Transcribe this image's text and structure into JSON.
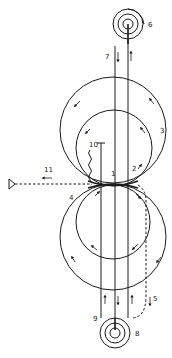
{
  "diagram": {
    "type": "technical-schematic",
    "colors": {
      "ink": "#1a1a1a",
      "background": "#ffffff"
    },
    "labels": {
      "l1": "1",
      "l2": "2",
      "l3": "3",
      "l4": "4",
      "l5": "5",
      "l6": "6",
      "l7": "7",
      "l8": "8",
      "l9": "9",
      "l10": "10",
      "l11": "11"
    },
    "components": [
      {
        "id": "1",
        "name": "contact-point"
      },
      {
        "id": "2",
        "name": "upper-inner-path"
      },
      {
        "id": "3",
        "name": "upper-outer-circle"
      },
      {
        "id": "4",
        "name": "lower-outer-circle"
      },
      {
        "id": "5",
        "name": "dashed-return-path"
      },
      {
        "id": "6",
        "name": "upper-spool"
      },
      {
        "id": "7",
        "name": "downward-strand"
      },
      {
        "id": "8",
        "name": "lower-spool"
      },
      {
        "id": "9",
        "name": "upward-strand"
      },
      {
        "id": "10",
        "name": "wavy-lead"
      },
      {
        "id": "11",
        "name": "dashed-output-beam"
      }
    ]
  }
}
